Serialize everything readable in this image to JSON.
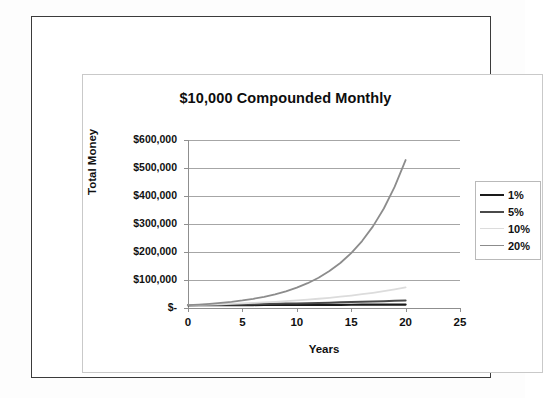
{
  "chart_data": {
    "type": "line",
    "title": "$10,000 Compounded Monthly",
    "xlabel": "Years",
    "ylabel": "Total Money",
    "xlim": [
      0,
      25
    ],
    "ylim": [
      0,
      600000
    ],
    "x_ticks": [
      "0",
      "5",
      "10",
      "15",
      "20",
      "25"
    ],
    "x_tick_values": [
      0,
      5,
      10,
      15,
      20,
      25
    ],
    "y_ticks": [
      "$-",
      "$100,000",
      "$200,000",
      "$300,000",
      "$400,000",
      "$500,000",
      "$600,000"
    ],
    "y_tick_values": [
      0,
      100000,
      200000,
      300000,
      400000,
      500000,
      600000
    ],
    "grid": "horizontal",
    "legend_position": "right",
    "principal": 10000,
    "compounding": "monthly",
    "x": [
      0,
      1,
      2,
      3,
      4,
      5,
      6,
      7,
      8,
      9,
      10,
      11,
      12,
      13,
      14,
      15,
      16,
      17,
      18,
      19,
      20
    ],
    "series": [
      {
        "name": "1%",
        "rate": 0.01,
        "color": "#1a1a1a",
        "width": 2.2,
        "values": [
          10000,
          10101,
          10202,
          10305,
          10408,
          10512,
          10618,
          10724,
          10831,
          10939,
          11048,
          11158,
          11270,
          11382,
          11495,
          11610,
          11725,
          11842,
          11959,
          12078,
          12198
        ]
      },
      {
        "name": "5%",
        "rate": 0.05,
        "color": "#4a4a4a",
        "width": 2.0,
        "values": [
          10000,
          10512,
          11049,
          11615,
          12209,
          12834,
          13490,
          14180,
          14906,
          15669,
          16470,
          17313,
          18199,
          19130,
          20109,
          21137,
          22218,
          23354,
          24549,
          25804,
          27126
        ]
      },
      {
        "name": "10%",
        "rate": 0.1,
        "color": "#dcdcdc",
        "width": 1.8,
        "values": [
          10000,
          11047,
          12204,
          13482,
          14894,
          16453,
          18177,
          20079,
          22182,
          24504,
          27070,
          29906,
          33039,
          36500,
          40323,
          44546,
          49209,
          54363,
          60056,
          66349,
          73281
        ]
      },
      {
        "name": "20%",
        "rate": 0.2,
        "color": "#8c8c8c",
        "width": 1.8,
        "values": [
          10000,
          12194,
          14869,
          18131,
          22111,
          26964,
          32882,
          40100,
          48894,
          59620,
          72703,
          88659,
          108114,
          131834,
          160755,
          196018,
          239019,
          291454,
          355390,
          433350,
          528414
        ]
      }
    ]
  },
  "chart": {
    "title": "$10,000 Compounded Monthly",
    "y_axis_title": "Total Money",
    "x_axis_title": "Years",
    "y_labels": [
      "$600,000",
      "$500,000",
      "$400,000",
      "$300,000",
      "$200,000",
      "$100,000",
      "$-"
    ],
    "x_labels": [
      "0",
      "5",
      "10",
      "15",
      "20",
      "25"
    ],
    "legend": [
      {
        "label": "1%",
        "color": "#1a1a1a"
      },
      {
        "label": "5%",
        "color": "#4a4a4a"
      },
      {
        "label": "10%",
        "color": "#dcdcdc"
      },
      {
        "label": "20%",
        "color": "#8c8c8c"
      }
    ]
  }
}
